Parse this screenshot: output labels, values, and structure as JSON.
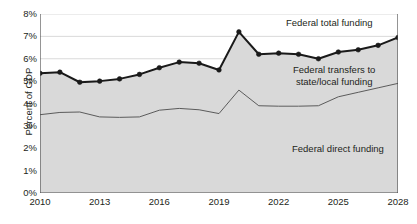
{
  "axes": {
    "ylabel": "Percent of GDP",
    "yticks": [
      "0%",
      "1%",
      "2%",
      "3%",
      "4%",
      "5%",
      "6%",
      "7%",
      "8%"
    ],
    "xticks": [
      "2010",
      "2013",
      "2016",
      "2019",
      "2022",
      "2025",
      "2028"
    ]
  },
  "annotations": {
    "total": "Federal total funding",
    "transfers_line1": "Federal transfers to",
    "transfers_line2": "state/local funding",
    "direct": "Federal direct funding"
  },
  "colors": {
    "area_fill": "#d9d9d9",
    "total_line": "#1a1a1a",
    "transfers_line": "#5a5a5a",
    "gridline": "#d0d0d0",
    "axis": "#4d4d4d",
    "text": "#231f20"
  },
  "chart_data": {
    "type": "area",
    "title": "",
    "xlabel": "",
    "ylabel": "Percent of GDP",
    "xlim": [
      2010,
      2028
    ],
    "ylim": [
      0,
      8
    ],
    "ytick_values": [
      0,
      1,
      2,
      3,
      4,
      5,
      6,
      7,
      8
    ],
    "xtick_values": [
      2010,
      2013,
      2016,
      2019,
      2022,
      2025,
      2028
    ],
    "grid": true,
    "legend": "inline-annotations",
    "x": [
      2010,
      2011,
      2012,
      2013,
      2014,
      2015,
      2016,
      2017,
      2018,
      2019,
      2020,
      2021,
      2022,
      2023,
      2024,
      2025,
      2026,
      2027,
      2028
    ],
    "series": [
      {
        "name": "Federal total funding",
        "markers": true,
        "values": [
          5.35,
          5.4,
          4.95,
          5.0,
          5.1,
          5.3,
          5.6,
          5.85,
          5.8,
          5.5,
          7.2,
          6.2,
          6.25,
          6.2,
          6.0,
          6.3,
          6.4,
          6.6,
          6.95
        ]
      },
      {
        "name": "Federal transfers to state/local funding",
        "markers": false,
        "values": [
          3.5,
          3.6,
          3.62,
          3.4,
          3.38,
          3.4,
          3.7,
          3.78,
          3.72,
          3.55,
          4.6,
          3.9,
          3.88,
          3.88,
          3.9,
          4.3,
          4.5,
          4.7,
          4.9
        ]
      },
      {
        "name": "Federal direct funding",
        "markers": false,
        "note": "shaded area below the transfers line is not plotted as its own curve; it is the region between 0% and the transfers curve",
        "values": [
          3.5,
          3.6,
          3.62,
          3.4,
          3.38,
          3.4,
          3.7,
          3.78,
          3.72,
          3.55,
          4.6,
          3.9,
          3.88,
          3.88,
          3.9,
          4.3,
          4.5,
          4.7,
          4.9
        ]
      }
    ]
  }
}
